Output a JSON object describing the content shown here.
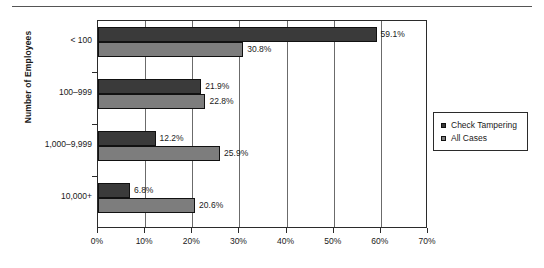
{
  "chart_data": {
    "type": "bar",
    "orientation": "horizontal",
    "title": "",
    "xlabel": "",
    "ylabel": "Number of Employees",
    "categories": [
      "< 100",
      "100–999",
      "1,000–9,999",
      "10,000+"
    ],
    "series": [
      {
        "name": "Check Tampering",
        "color": "#3a3a3a",
        "values": [
          59.1,
          21.9,
          12.2,
          6.8
        ],
        "labels": [
          "59.1%",
          "21.9%",
          "12.2%",
          "6.8%"
        ]
      },
      {
        "name": "All Cases",
        "color": "#7d7d7d",
        "values": [
          30.8,
          22.8,
          25.9,
          20.6
        ],
        "labels": [
          "30.8%",
          "22.8%",
          "25.9%",
          "20.6%"
        ]
      }
    ],
    "xlim": [
      0,
      70
    ],
    "xticks": [
      0,
      10,
      20,
      30,
      40,
      50,
      60,
      70
    ],
    "xtick_labels": [
      "0%",
      "10%",
      "20%",
      "30%",
      "40%",
      "50%",
      "60%",
      "70%"
    ],
    "grid": "vertical",
    "legend_position": "right"
  },
  "legend": {
    "items": [
      {
        "label": "Check Tampering",
        "color": "#3a3a3a"
      },
      {
        "label": "All Cases",
        "color": "#7d7d7d"
      }
    ]
  }
}
